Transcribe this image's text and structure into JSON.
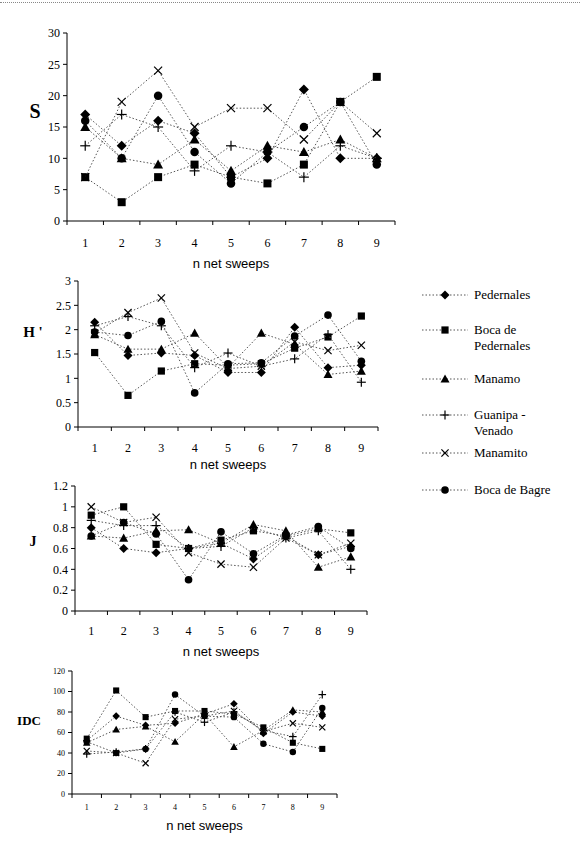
{
  "legend": {
    "items": [
      {
        "name": "Pedernales",
        "marker": "diamond"
      },
      {
        "name": "Boca de Pedernales",
        "marker": "square"
      },
      {
        "name": "Manamo",
        "marker": "triangle"
      },
      {
        "name": "Guanipa - Venado",
        "marker": "plus"
      },
      {
        "name": "Manamito",
        "marker": "cross"
      },
      {
        "name": "Boca de Bagre",
        "marker": "circle"
      }
    ]
  },
  "chart_data": [
    {
      "type": "line",
      "title": "",
      "xlabel": "n net sweeps",
      "ylabel": "S",
      "x": [
        1,
        2,
        3,
        4,
        5,
        6,
        7,
        8,
        9
      ],
      "ylim": [
        0,
        30
      ],
      "yticks": [
        "0",
        "5",
        "10",
        "15",
        "20",
        "25",
        "30"
      ],
      "xticks": [
        "1",
        "2",
        "3",
        "4",
        "5",
        "6",
        "7",
        "8",
        "9"
      ],
      "grid": false,
      "legend": "right",
      "series": [
        {
          "name": "Pedernales",
          "marker": "diamond",
          "values": [
            17,
            12,
            16,
            14,
            7,
            10,
            21,
            10,
            10
          ]
        },
        {
          "name": "Boca de Pedernales",
          "marker": "square",
          "values": [
            7,
            3,
            7,
            9,
            7,
            6,
            9,
            19,
            23
          ]
        },
        {
          "name": "Manamo",
          "marker": "triangle",
          "values": [
            15,
            10,
            9,
            13,
            8,
            12,
            11,
            13,
            10
          ]
        },
        {
          "name": "Guanipa - Venado",
          "marker": "plus",
          "values": [
            12,
            17,
            15,
            8,
            12,
            11,
            7,
            12,
            10
          ]
        },
        {
          "name": "Manamito",
          "marker": "cross",
          "values": [
            7,
            19,
            24,
            15,
            18,
            18,
            13,
            19,
            14
          ]
        },
        {
          "name": "Boca de Bagre",
          "marker": "circle",
          "values": [
            16,
            10,
            20,
            11,
            6,
            11,
            15,
            19,
            9
          ]
        }
      ]
    },
    {
      "type": "line",
      "title": "",
      "xlabel": "n net sweeps",
      "ylabel": "H '",
      "x": [
        1,
        2,
        3,
        4,
        5,
        6,
        7,
        8,
        9
      ],
      "ylim": [
        0,
        3
      ],
      "yticks": [
        "0",
        "0.5",
        "1",
        "1.5",
        "2",
        "2.5",
        "3"
      ],
      "xticks": [
        "1",
        "2",
        "3",
        "4",
        "5",
        "6",
        "7",
        "8",
        "9"
      ],
      "grid": false,
      "legend": "right",
      "series": [
        {
          "name": "Pedernales",
          "marker": "diamond",
          "values": [
            2.15,
            1.47,
            1.52,
            1.47,
            1.12,
            1.12,
            2.05,
            1.22,
            1.27
          ]
        },
        {
          "name": "Boca de Pedernales",
          "marker": "square",
          "values": [
            1.53,
            0.65,
            1.15,
            1.3,
            1.27,
            1.3,
            1.62,
            1.85,
            2.28
          ]
        },
        {
          "name": "Manamo",
          "marker": "triangle",
          "values": [
            1.9,
            1.6,
            1.6,
            1.93,
            1.22,
            1.93,
            1.7,
            1.08,
            1.15
          ]
        },
        {
          "name": "Guanipa - Venado",
          "marker": "plus",
          "values": [
            2.08,
            2.27,
            2.08,
            1.22,
            1.52,
            1.25,
            1.4,
            1.9,
            0.92
          ]
        },
        {
          "name": "Manamito",
          "marker": "cross",
          "values": [
            1.93,
            2.35,
            2.65,
            1.52,
            1.2,
            1.25,
            1.75,
            1.57,
            1.68
          ]
        },
        {
          "name": "Boca de Bagre",
          "marker": "circle",
          "values": [
            1.95,
            1.88,
            2.17,
            0.7,
            1.3,
            1.32,
            1.87,
            2.3,
            1.35
          ]
        }
      ]
    },
    {
      "type": "line",
      "title": "",
      "xlabel": "n net sweeps",
      "ylabel": "J",
      "x": [
        1,
        2,
        3,
        4,
        5,
        6,
        7,
        8,
        9
      ],
      "ylim": [
        0,
        1.2
      ],
      "yticks": [
        "0",
        "0.2",
        "0.4",
        "0.6",
        "0.8",
        "1",
        "1.2"
      ],
      "xticks": [
        "1",
        "2",
        "3",
        "4",
        "5",
        "6",
        "7",
        "8",
        "9"
      ],
      "grid": false,
      "legend": "right",
      "series": [
        {
          "name": "Pedernales",
          "marker": "diamond",
          "values": [
            0.8,
            0.6,
            0.56,
            0.6,
            0.65,
            0.5,
            0.72,
            0.54,
            0.62
          ]
        },
        {
          "name": "Boca de Pedernales",
          "marker": "square",
          "values": [
            0.92,
            1.0,
            0.64,
            0.6,
            0.68,
            0.77,
            0.72,
            0.79,
            0.75
          ]
        },
        {
          "name": "Manamo",
          "marker": "triangle",
          "values": [
            0.72,
            0.7,
            0.77,
            0.78,
            0.65,
            0.83,
            0.77,
            0.42,
            0.52
          ]
        },
        {
          "name": "Guanipa - Venado",
          "marker": "plus",
          "values": [
            0.87,
            0.82,
            0.82,
            0.6,
            0.62,
            0.8,
            0.7,
            0.77,
            0.4
          ]
        },
        {
          "name": "Manamito",
          "marker": "cross",
          "values": [
            1.0,
            0.85,
            0.9,
            0.56,
            0.45,
            0.42,
            0.7,
            0.54,
            0.65
          ]
        },
        {
          "name": "Boca de Bagre",
          "marker": "circle",
          "values": [
            0.72,
            0.85,
            0.74,
            0.3,
            0.76,
            0.55,
            0.73,
            0.81,
            0.6
          ]
        }
      ]
    },
    {
      "type": "line",
      "title": "",
      "xlabel": "n net sweeps",
      "ylabel": "IDC",
      "x": [
        1,
        2,
        3,
        4,
        5,
        6,
        7,
        8,
        9
      ],
      "ylim": [
        0,
        120
      ],
      "yticks": [
        "0",
        "20",
        "40",
        "60",
        "80",
        "100",
        "120"
      ],
      "xticks": [
        "1",
        "2",
        "3",
        "4",
        "5",
        "6",
        "7",
        "8",
        "9"
      ],
      "grid": false,
      "legend": "right",
      "series": [
        {
          "name": "Pedernales",
          "marker": "diamond",
          "values": [
            52,
            76,
            67,
            69,
            78,
            88,
            59,
            80,
            76
          ]
        },
        {
          "name": "Boca de Pedernales",
          "marker": "square",
          "values": [
            54,
            101,
            75,
            81,
            81,
            78,
            65,
            50,
            44
          ]
        },
        {
          "name": "Manamo",
          "marker": "triangle",
          "values": [
            50,
            63,
            66,
            51,
            78,
            46,
            62,
            82,
            80
          ]
        },
        {
          "name": "Guanipa - Venado",
          "marker": "plus",
          "values": [
            39,
            41,
            44,
            80,
            70,
            80,
            62,
            56,
            97
          ]
        },
        {
          "name": "Manamito",
          "marker": "cross",
          "values": [
            42,
            40,
            30,
            73,
            76,
            81,
            61,
            69,
            65
          ]
        },
        {
          "name": "Boca de Bagre",
          "marker": "circle",
          "values": [
            51,
            40,
            44,
            97,
            76,
            75,
            49,
            41,
            84
          ]
        }
      ]
    }
  ]
}
